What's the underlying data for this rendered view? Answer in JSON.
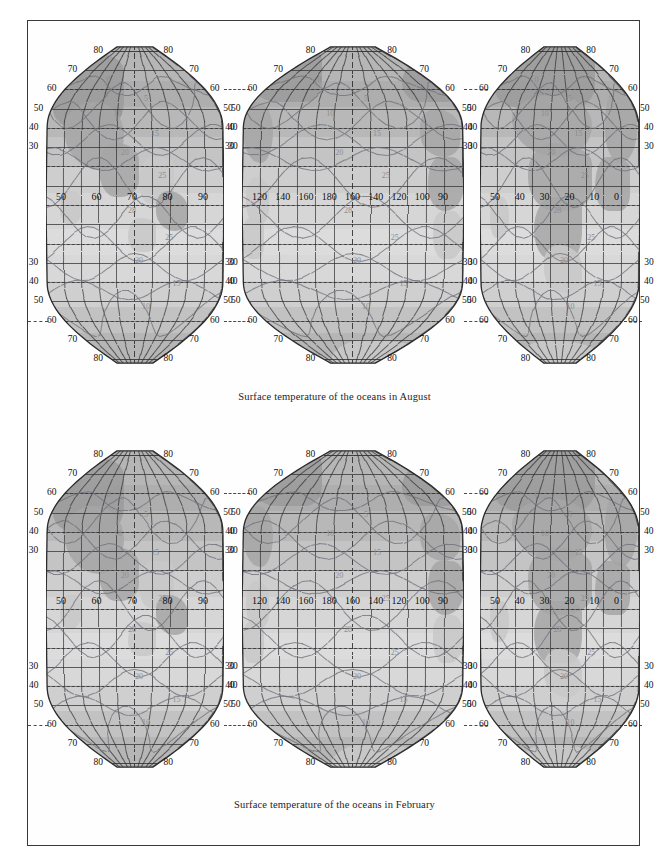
{
  "figure": {
    "panels": [
      {
        "id": "august",
        "caption": "Surface temperature of the oceans in August",
        "projection": "interrupted-goode-homolosine"
      },
      {
        "id": "february",
        "caption": "Surface temperature of the oceans in February",
        "projection": "interrupted-goode-homolosine"
      }
    ],
    "graticule": {
      "latitude_labels_outer": [
        "80",
        "70",
        "60",
        "50",
        "40",
        "30",
        "30",
        "40",
        "50",
        "60",
        "70",
        "80"
      ],
      "latitude_interval_deg": 10,
      "longitude_interval_deg": 10,
      "equator_label_row": {
        "lobe1": [
          "50",
          "60",
          "70",
          "80",
          "90"
        ],
        "lobe2": [
          "120",
          "140",
          "160",
          "180",
          "160",
          "140",
          "120",
          "100",
          "90"
        ],
        "lobe3": [
          "50",
          "40",
          "30",
          "20",
          "10",
          "0"
        ]
      }
    },
    "colors": {
      "ocean_warm": "#dcdcdc",
      "ocean_cool": "#adadad",
      "land": "#a6a6a6",
      "graticule": "#2e2e2e",
      "contour": "#6e6e76",
      "frame": "#3a3a3a",
      "text": "#24242a"
    }
  },
  "chart_data": {
    "type": "map",
    "title": "Surface temperature of the oceans",
    "subtitle": "",
    "xlabel": "Longitude (degrees)",
    "ylabel": "Latitude (degrees)",
    "variable": "Sea surface temperature",
    "units": "degrees Celsius",
    "contour_interval": 5,
    "contour_levels": [
      0,
      5,
      10,
      15,
      20,
      25,
      28
    ],
    "projection": "Interrupted sinusoidal / Goode homolosine (three lobes)",
    "grid": true,
    "legend": "none",
    "xlim": [
      -180,
      180
    ],
    "ylim": [
      -80,
      80
    ],
    "panels": [
      {
        "name": "August",
        "caption": "Surface temperature of the oceans in August",
        "labelled_isotherms": [
          {
            "value": 28,
            "lobes": [
              "lobe1",
              "lobe2",
              "lobe3"
            ]
          },
          {
            "value": 25,
            "lobes": [
              "lobe1",
              "lobe2",
              "lobe3"
            ]
          },
          {
            "value": 20,
            "lobes": [
              "lobe1",
              "lobe2",
              "lobe3"
            ]
          },
          {
            "value": 15,
            "lobes": [
              "lobe1",
              "lobe2",
              "lobe3"
            ]
          },
          {
            "value": 10,
            "lobes": [
              "lobe1",
              "lobe3"
            ]
          },
          {
            "value": 5,
            "lobes": [
              "lobe1",
              "lobe2"
            ]
          },
          {
            "value": 0,
            "lobes": [
              "lobe1",
              "lobe2"
            ]
          }
        ]
      },
      {
        "name": "February",
        "caption": "Surface temperature of the oceans in February",
        "labelled_isotherms": [
          {
            "value": 28,
            "lobes": [
              "lobe3"
            ]
          },
          {
            "value": 25,
            "lobes": [
              "lobe1",
              "lobe2",
              "lobe3"
            ]
          },
          {
            "value": 20,
            "lobes": [
              "lobe1",
              "lobe2",
              "lobe3"
            ]
          },
          {
            "value": 15,
            "lobes": [
              "lobe1",
              "lobe2",
              "lobe3"
            ]
          },
          {
            "value": 10,
            "lobes": [
              "lobe1",
              "lobe2",
              "lobe3"
            ]
          },
          {
            "value": 5,
            "lobes": [
              "lobe1",
              "lobe2",
              "lobe3"
            ]
          },
          {
            "value": 0,
            "lobes": [
              "lobe1",
              "lobe2",
              "lobe3"
            ]
          }
        ]
      }
    ],
    "latitude_ticks": [
      80,
      70,
      60,
      50,
      40,
      30,
      20,
      10,
      0,
      -10,
      -20,
      -30,
      -40,
      -50,
      -60,
      -70,
      -80
    ],
    "longitude_ticks_labelled": [
      {
        "lobe": 1,
        "labels": [
          50,
          60,
          70,
          80,
          90
        ]
      },
      {
        "lobe": 2,
        "labels": [
          120,
          140,
          160,
          180,
          160,
          140,
          120,
          100,
          90
        ]
      },
      {
        "lobe": 3,
        "labels": [
          50,
          40,
          30,
          20,
          10,
          0
        ]
      }
    ]
  }
}
